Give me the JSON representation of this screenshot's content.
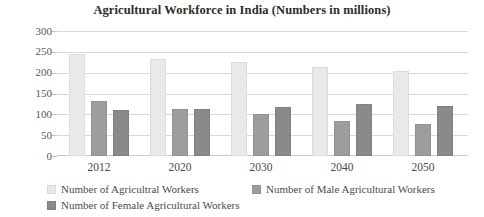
{
  "chart_data": {
    "type": "bar",
    "title": "Agricultural Workforce in India (Numbers in millions)",
    "xlabel": "",
    "ylabel": "",
    "ylim": [
      0,
      300
    ],
    "ytick_step": 50,
    "yticks": [
      300,
      250,
      200,
      150,
      100,
      50,
      0
    ],
    "grid": true,
    "legend_position": "bottom",
    "categories": [
      "2012",
      "2020",
      "2030",
      "2040",
      "2050"
    ],
    "series": [
      {
        "name": "Number of Agricultral Workers",
        "color": "#e9e9e9",
        "values": [
          245,
          232,
          225,
          213,
          203
        ]
      },
      {
        "name": "Number of  Male Agricultural Workers",
        "color": "#9d9d9d",
        "values": [
          133,
          113,
          100,
          83,
          77
        ]
      },
      {
        "name": "Number of Female Agricultural Workers",
        "color": "#8a8a8a",
        "values": [
          110,
          112,
          118,
          124,
          120
        ]
      }
    ]
  },
  "axis": {
    "y_tick_labels": [
      "300",
      "250",
      "200",
      "150",
      "100",
      "50",
      "0"
    ],
    "x_tick_labels": [
      "2012",
      "2020",
      "2030",
      "2040",
      "2050"
    ]
  },
  "legend": {
    "items": [
      {
        "label": "Number of Agricultral Workers"
      },
      {
        "label": "Number of  Male Agricultural Workers"
      },
      {
        "label": "Number of Female Agricultural Workers"
      }
    ]
  }
}
